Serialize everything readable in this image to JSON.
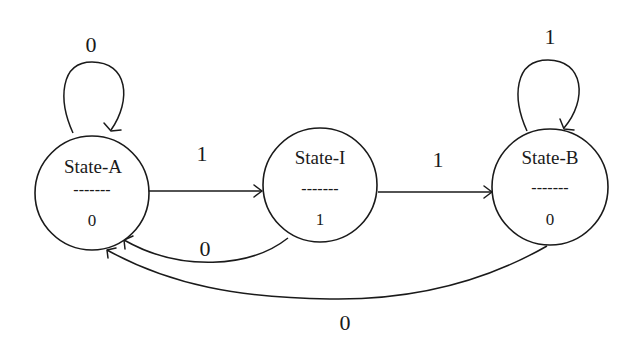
{
  "diagram": {
    "type": "state-machine",
    "title": "",
    "stroke_color": "#1a1a1a",
    "background": "#ffffff",
    "states": [
      {
        "id": "A",
        "name": "State-A",
        "divider": "-------",
        "output": "0"
      },
      {
        "id": "I",
        "name": "State-I",
        "divider": "-------",
        "output": "1"
      },
      {
        "id": "B",
        "name": "State-B",
        "divider": "-------",
        "output": "0"
      }
    ],
    "transitions": [
      {
        "from": "A",
        "to": "A",
        "label": "0"
      },
      {
        "from": "A",
        "to": "I",
        "label": "1"
      },
      {
        "from": "I",
        "to": "B",
        "label": "1"
      },
      {
        "from": "B",
        "to": "B",
        "label": "1"
      },
      {
        "from": "I",
        "to": "A",
        "label": "0"
      },
      {
        "from": "B",
        "to": "A",
        "label": "0"
      }
    ]
  }
}
